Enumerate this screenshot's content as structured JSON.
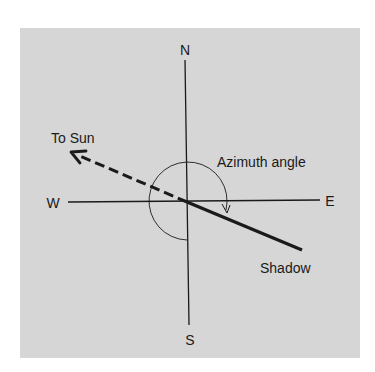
{
  "diagram": {
    "type": "compass-azimuth",
    "background_color": "#d6d6d6",
    "line_color": "#1a1a1a",
    "labels": {
      "north": "N",
      "south": "S",
      "east": "E",
      "west": "W",
      "to_sun": "To Sun",
      "azimuth_angle": "Azimuth angle",
      "shadow": "Shadow"
    },
    "center": [
      187,
      202
    ],
    "elements": [
      {
        "id": "north-south-axis",
        "style": "solid-thin"
      },
      {
        "id": "east-west-axis",
        "style": "solid-thin"
      },
      {
        "id": "sun-direction",
        "style": "dashed-thick",
        "arrow": "toward sun (northwest)"
      },
      {
        "id": "shadow-line",
        "style": "solid-thick",
        "direction": "southeast"
      },
      {
        "id": "azimuth-arc",
        "style": "thin",
        "arrow": "ends at shadow line",
        "sweep": "clockwise from south"
      }
    ]
  }
}
